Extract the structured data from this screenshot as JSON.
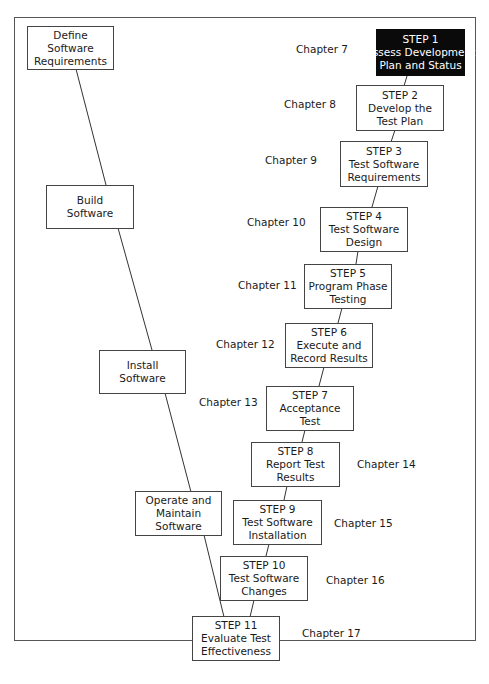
{
  "diagram": {
    "type": "dual-V process flow",
    "left_track": [
      {
        "id": "define",
        "lines": [
          "Define",
          "Software",
          "Requirements"
        ]
      },
      {
        "id": "build",
        "lines": [
          "Build",
          "Software"
        ]
      },
      {
        "id": "install",
        "lines": [
          "Install",
          "Software"
        ]
      },
      {
        "id": "operate",
        "lines": [
          "Operate and",
          "Maintain",
          "Software"
        ]
      }
    ],
    "steps": [
      {
        "step": "STEP 1",
        "lines": [
          "Assess Development",
          "Plan and Status"
        ],
        "chapter": "Chapter 7",
        "highlighted": true
      },
      {
        "step": "STEP 2",
        "lines": [
          "Develop the",
          "Test Plan"
        ],
        "chapter": "Chapter 8"
      },
      {
        "step": "STEP 3",
        "lines": [
          "Test Software",
          "Requirements"
        ],
        "chapter": "Chapter 9"
      },
      {
        "step": "STEP 4",
        "lines": [
          "Test Software",
          "Design"
        ],
        "chapter": "Chapter 10"
      },
      {
        "step": "STEP 5",
        "lines": [
          "Program Phase",
          "Testing"
        ],
        "chapter": "Chapter 11"
      },
      {
        "step": "STEP 6",
        "lines": [
          "Execute and",
          "Record Results"
        ],
        "chapter": "Chapter 12"
      },
      {
        "step": "STEP 7",
        "lines": [
          "Acceptance",
          "Test"
        ],
        "chapter": "Chapter 13"
      },
      {
        "step": "STEP 8",
        "lines": [
          "Report Test",
          "Results"
        ],
        "chapter": "Chapter 14"
      },
      {
        "step": "STEP 9",
        "lines": [
          "Test Software",
          "Installation"
        ],
        "chapter": "Chapter 15"
      },
      {
        "step": "STEP 10",
        "lines": [
          "Test Software",
          "Changes"
        ],
        "chapter": "Chapter 16"
      },
      {
        "step": "STEP 11",
        "lines": [
          "Evaluate Test",
          "Effectiveness"
        ],
        "chapter": "Chapter 17"
      }
    ],
    "colors": {
      "highlight_bg": "#0a0a0a",
      "highlight_text": "#ffffff",
      "border": "#444444"
    }
  }
}
